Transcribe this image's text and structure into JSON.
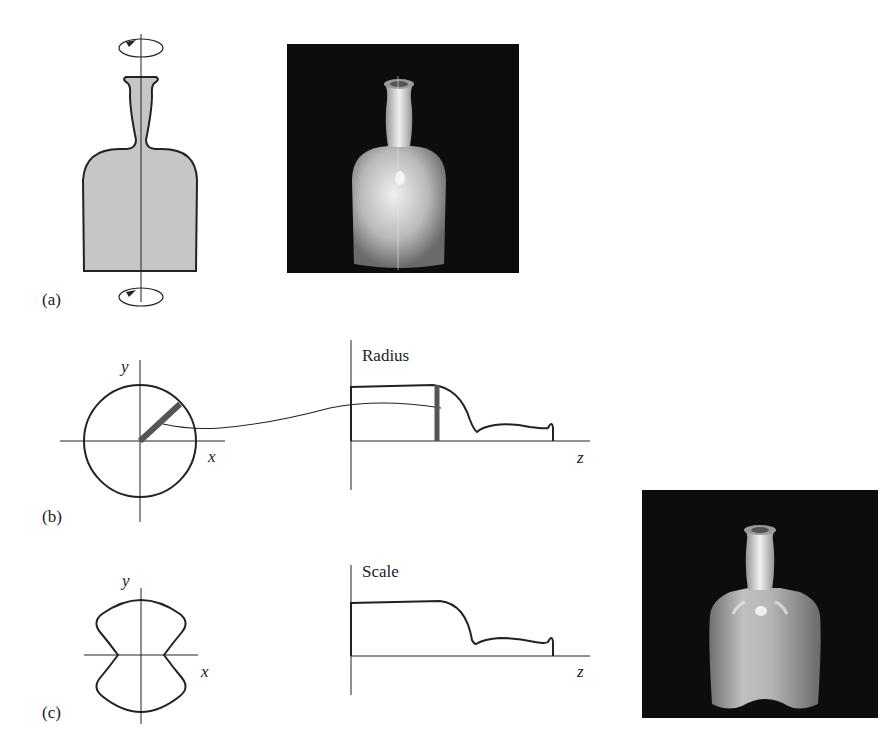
{
  "figure": {
    "panels": {
      "a": {
        "label": "(a)",
        "description": "Bottle profile swept around vertical axis (surface of revolution)"
      },
      "b": {
        "label": "(b)",
        "description": "Circular cross-section with radius function along z",
        "cross_section": {
          "x_label": "x",
          "y_label": "y",
          "shape": "circle"
        },
        "graph": {
          "title": "Radius",
          "x_label": "z"
        }
      },
      "c": {
        "label": "(c)",
        "description": "Non-circular cross-section with scale function along z",
        "cross_section": {
          "x_label": "x",
          "y_label": "y",
          "shape": "pinched-waist"
        },
        "graph": {
          "title": "Scale",
          "x_label": "z"
        }
      }
    },
    "renders": [
      {
        "id": "render-a",
        "description": "Shaded rendering of round bottle"
      },
      {
        "id": "render-c",
        "description": "Shaded rendering of swept bottle with pinched cross-section"
      }
    ],
    "colors": {
      "ink": "#222222",
      "profile_fill": "#c8c8c8",
      "render_background": "#0d0d0d",
      "radius_bar": "#555555"
    }
  }
}
